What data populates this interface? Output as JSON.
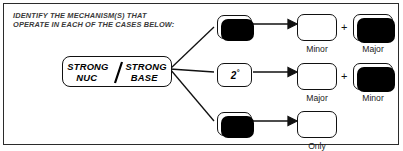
{
  "caption": {
    "line1": "IDENTIFY THE MECHANISM(S) THAT",
    "line2": "OPERATE IN EACH OF THE CASES BELOW:"
  },
  "center_box": {
    "line1": "STRONG      STRONG",
    "line2": "NUC            BASE",
    "separator": "/",
    "full_text": "STRONG NUC / STRONG BASE"
  },
  "branches": [
    {
      "mechanism": "1",
      "degree": "°",
      "products": [
        {
          "caption": "Minor",
          "emphasis": "plain"
        },
        {
          "caption": "Major",
          "emphasis": "shadow"
        }
      ],
      "operator": "+"
    },
    {
      "mechanism": "2",
      "degree": "°",
      "products": [
        {
          "caption": "Major",
          "emphasis": "plain"
        },
        {
          "caption": "Minor",
          "emphasis": "shadow"
        }
      ],
      "operator": "+"
    },
    {
      "mechanism": "3",
      "degree": "°",
      "products": [
        {
          "caption": "Only",
          "emphasis": "plain"
        }
      ],
      "operator": ""
    }
  ],
  "colors": {
    "ink": "#000000",
    "frame": "#2b2b2b",
    "caption_gray": "#3a3a3a",
    "paper": "#ffffff"
  }
}
